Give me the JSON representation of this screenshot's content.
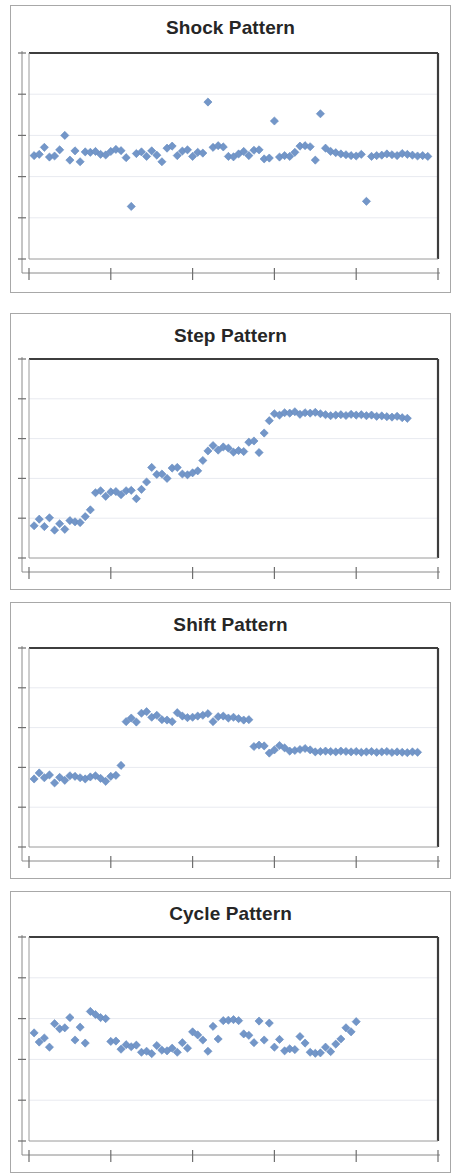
{
  "figure": {
    "background_color": "#ffffff",
    "panel_border_color": "#a8a8a8",
    "axis_color": "#000000",
    "gridline_color": "#e8eaf0",
    "marker_color": "#7396c8",
    "marker_edge_color": "#6389bf",
    "marker_shape": "diamond",
    "title_color": "#262626"
  },
  "panels": [
    {
      "id": "shock",
      "title": "Shock Pattern",
      "icon": "scatter-chart-icon"
    },
    {
      "id": "step",
      "title": "Step Pattern",
      "icon": "scatter-chart-icon"
    },
    {
      "id": "shift",
      "title": "Shift Pattern",
      "icon": "scatter-chart-icon"
    },
    {
      "id": "cycle",
      "title": "Cycle Pattern",
      "icon": "scatter-chart-icon"
    }
  ],
  "chart_data": [
    {
      "type": "scatter",
      "title": "Shock Pattern",
      "xlabel": "",
      "ylabel": "",
      "xlim": [
        0,
        80
      ],
      "ylim": [
        0,
        10
      ],
      "grid": true,
      "gridlines_y": [
        2,
        4,
        6,
        8
      ],
      "xticks": [
        0,
        16,
        32,
        48,
        64,
        80
      ],
      "yticks": [
        0,
        2,
        4,
        6,
        8,
        10
      ],
      "legend": null,
      "series": [
        {
          "name": "observation",
          "x": [
            1,
            2,
            3,
            4,
            5,
            6,
            7,
            8,
            9,
            10,
            11,
            12,
            13,
            14,
            15,
            16,
            17,
            18,
            19,
            20,
            21,
            22,
            23,
            24,
            25,
            26,
            27,
            28,
            29,
            30,
            31,
            32,
            33,
            34,
            35,
            36,
            37,
            38,
            39,
            40,
            41,
            42,
            43,
            44,
            45,
            46,
            47,
            48,
            49,
            50,
            51,
            52,
            53,
            54,
            55,
            56,
            57,
            58,
            59,
            60,
            61,
            62,
            63,
            64,
            65,
            66,
            67,
            68,
            69,
            70,
            71,
            72,
            73,
            74,
            75,
            76,
            77,
            78
          ],
          "y": [
            5.02,
            5.08,
            5.42,
            4.95,
            5.0,
            5.3,
            6.0,
            4.8,
            5.25,
            4.72,
            5.2,
            5.18,
            5.22,
            5.08,
            5.05,
            5.22,
            5.32,
            5.26,
            4.92,
            2.55,
            5.12,
            5.2,
            4.98,
            5.25,
            5.04,
            4.72,
            5.38,
            5.48,
            5.02,
            5.24,
            5.3,
            4.98,
            5.18,
            5.14,
            7.62,
            5.42,
            5.5,
            5.44,
            4.98,
            4.96,
            5.1,
            5.22,
            5.02,
            5.28,
            5.3,
            4.86,
            4.9,
            6.7,
            4.95,
            5.02,
            4.98,
            5.18,
            5.48,
            5.5,
            5.45,
            4.8,
            7.05,
            5.38,
            5.22,
            5.16,
            5.1,
            5.06,
            5.02,
            5.0,
            5.08,
            2.8,
            4.98,
            5.02,
            5.04,
            5.1,
            5.06,
            5.02,
            5.12,
            5.08,
            5.04,
            5.0,
            5.02,
            4.98
          ]
        }
      ]
    },
    {
      "type": "scatter",
      "title": "Step Pattern",
      "xlabel": "",
      "ylabel": "",
      "xlim": [
        0,
        80
      ],
      "ylim": [
        0,
        10
      ],
      "grid": true,
      "gridlines_y": [
        2,
        4,
        6,
        8
      ],
      "xticks": [
        0,
        16,
        32,
        48,
        64,
        80
      ],
      "yticks": [
        0,
        2,
        4,
        6,
        8,
        10
      ],
      "legend": null,
      "series": [
        {
          "name": "observation",
          "x": [
            1,
            2,
            3,
            4,
            5,
            6,
            7,
            8,
            9,
            10,
            11,
            12,
            13,
            14,
            15,
            16,
            17,
            18,
            19,
            20,
            21,
            22,
            23,
            24,
            25,
            26,
            27,
            28,
            29,
            30,
            31,
            32,
            33,
            34,
            35,
            36,
            37,
            38,
            39,
            40,
            41,
            42,
            43,
            44,
            45,
            46,
            47,
            48,
            49,
            50,
            51,
            52,
            53,
            54,
            55,
            56,
            57,
            58,
            59,
            60,
            61,
            62,
            63,
            64,
            65,
            66,
            67,
            68,
            69,
            70,
            71,
            72,
            73,
            74
          ],
          "y": [
            1.62,
            1.95,
            1.58,
            2.02,
            1.4,
            1.72,
            1.44,
            1.88,
            1.82,
            1.78,
            2.08,
            2.42,
            3.28,
            3.38,
            3.1,
            3.32,
            3.34,
            3.18,
            3.38,
            3.4,
            2.98,
            3.45,
            3.82,
            4.55,
            4.2,
            4.22,
            4.0,
            4.52,
            4.55,
            4.22,
            4.18,
            4.28,
            4.38,
            4.9,
            5.38,
            5.65,
            5.42,
            5.58,
            5.52,
            5.32,
            5.4,
            5.35,
            5.82,
            5.88,
            5.3,
            6.28,
            6.9,
            7.25,
            7.18,
            7.3,
            7.28,
            7.35,
            7.22,
            7.3,
            7.28,
            7.32,
            7.25,
            7.2,
            7.15,
            7.18,
            7.2,
            7.16,
            7.22,
            7.18,
            7.2,
            7.15,
            7.18,
            7.12,
            7.14,
            7.1,
            7.08,
            7.12,
            7.05,
            7.02
          ]
        }
      ]
    },
    {
      "type": "scatter",
      "title": "Shift Pattern",
      "xlabel": "",
      "ylabel": "",
      "xlim": [
        0,
        80
      ],
      "ylim": [
        0,
        10
      ],
      "grid": true,
      "gridlines_y": [
        2,
        4,
        6,
        8
      ],
      "xticks": [
        0,
        16,
        32,
        48,
        64,
        80
      ],
      "yticks": [
        0,
        2,
        4,
        6,
        8,
        10
      ],
      "legend": null,
      "series": [
        {
          "name": "observation",
          "x": [
            1,
            2,
            3,
            4,
            5,
            6,
            7,
            8,
            9,
            10,
            11,
            12,
            13,
            14,
            15,
            16,
            17,
            18,
            19,
            20,
            21,
            22,
            23,
            24,
            25,
            26,
            27,
            28,
            29,
            30,
            31,
            32,
            33,
            34,
            35,
            36,
            37,
            38,
            39,
            40,
            41,
            42,
            43,
            44,
            45,
            46,
            47,
            48,
            49,
            50,
            51,
            52,
            53,
            54,
            55,
            56,
            57,
            58,
            59,
            60,
            61,
            62,
            63,
            64,
            65,
            66,
            67,
            68,
            69,
            70,
            71,
            72,
            73,
            74,
            75,
            76
          ],
          "y": [
            3.42,
            3.72,
            3.48,
            3.62,
            3.22,
            3.5,
            3.35,
            3.58,
            3.55,
            3.48,
            3.42,
            3.52,
            3.58,
            3.45,
            3.3,
            3.55,
            3.6,
            4.1,
            6.3,
            6.48,
            6.28,
            6.72,
            6.8,
            6.52,
            6.62,
            6.4,
            6.38,
            6.3,
            6.75,
            6.58,
            6.5,
            6.52,
            6.58,
            6.62,
            6.7,
            6.3,
            6.55,
            6.58,
            6.48,
            6.52,
            6.45,
            6.38,
            6.4,
            5.05,
            5.12,
            5.08,
            4.72,
            4.88,
            5.1,
            4.98,
            4.82,
            4.85,
            4.9,
            4.95,
            4.88,
            4.78,
            4.8,
            4.82,
            4.8,
            4.78,
            4.82,
            4.8,
            4.78,
            4.8,
            4.76,
            4.78,
            4.8,
            4.76,
            4.78,
            4.8,
            4.75,
            4.78,
            4.76,
            4.74,
            4.78,
            4.76
          ]
        }
      ]
    },
    {
      "type": "scatter",
      "title": "Cycle Pattern",
      "xlabel": "",
      "ylabel": "",
      "xlim": [
        0,
        80
      ],
      "ylim": [
        0,
        10
      ],
      "grid": true,
      "gridlines_y": [
        2,
        4,
        6,
        8
      ],
      "xticks": [
        0,
        16,
        32,
        48,
        64,
        80
      ],
      "yticks": [
        0,
        2,
        4,
        6,
        8,
        10
      ],
      "legend": null,
      "series": [
        {
          "name": "observation",
          "x": [
            1,
            2,
            3,
            4,
            5,
            6,
            7,
            8,
            9,
            10,
            11,
            12,
            13,
            14,
            15,
            16,
            17,
            18,
            19,
            20,
            21,
            22,
            23,
            24,
            25,
            26,
            27,
            28,
            29,
            30,
            31,
            32,
            33,
            34,
            35,
            36,
            37,
            38,
            39,
            40,
            41,
            42,
            43,
            44,
            45,
            46,
            47,
            48,
            49,
            50,
            51,
            52,
            53,
            54,
            55,
            56,
            57,
            58,
            59,
            60,
            61,
            62,
            63,
            64,
            65,
            66,
            67,
            68,
            69,
            70,
            71,
            72,
            73,
            74,
            75,
            76,
            77
          ],
          "y": [
            5.3,
            4.85,
            5.05,
            4.6,
            5.75,
            5.5,
            5.55,
            6.05,
            4.95,
            5.58,
            4.8,
            6.35,
            6.2,
            6.05,
            6.0,
            4.88,
            4.9,
            4.5,
            4.72,
            4.62,
            4.7,
            4.35,
            4.4,
            4.28,
            4.68,
            4.45,
            4.42,
            4.55,
            4.35,
            4.82,
            4.55,
            5.35,
            5.2,
            4.95,
            4.4,
            5.62,
            5.0,
            5.9,
            5.92,
            5.95,
            5.9,
            5.25,
            5.18,
            4.82,
            5.88,
            4.95,
            5.78,
            4.6,
            4.98,
            4.42,
            4.52,
            4.48,
            5.12,
            4.8,
            4.35,
            4.3,
            4.32,
            4.6,
            4.38,
            4.75,
            5.0,
            5.55,
            5.35,
            5.85
          ]
        }
      ]
    }
  ]
}
